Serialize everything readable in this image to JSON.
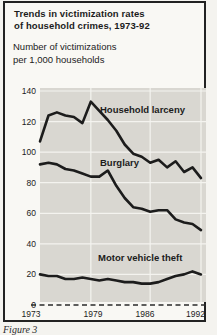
{
  "figure": {
    "title_line1": "Trends in victimization rates",
    "title_line2": "of household crimes, 1973-92",
    "subtitle_line1": "Number of victimizations",
    "subtitle_line2": "per 1,000 households",
    "caption": "Figure 3"
  },
  "colors": {
    "page_bg": "#f4f3ef",
    "figure_bg": "#f9f8f4",
    "border": "#222222",
    "plot_bg": "#d9d7d1",
    "gridline": "#f4f3ef",
    "line": "#1c1c1c",
    "text": "#1c1c1c"
  },
  "chart_data": {
    "type": "line",
    "title": "Trends in victimization rates of household crimes, 1973-92",
    "ylabel": "Number of victimizations per 1,000 households",
    "xlabel": "",
    "x": [
      1973,
      1974,
      1975,
      1976,
      1977,
      1978,
      1979,
      1980,
      1981,
      1982,
      1983,
      1984,
      1985,
      1986,
      1987,
      1988,
      1989,
      1990,
      1991,
      1992
    ],
    "series": [
      {
        "name": "Household larceny",
        "values": [
          107,
          124,
          126,
          124,
          123,
          119,
          133,
          127,
          121,
          114,
          105,
          99,
          97,
          93,
          95,
          90,
          94,
          87,
          90,
          83
        ]
      },
      {
        "name": "Burglary",
        "values": [
          92,
          93,
          92,
          89,
          88,
          86,
          84,
          84,
          88,
          78,
          70,
          64,
          63,
          61,
          62,
          62,
          56,
          54,
          53,
          49
        ]
      },
      {
        "name": "Motor vehicle theft",
        "values": [
          20,
          19,
          19,
          17,
          17,
          18,
          17,
          16,
          17,
          16,
          15,
          15,
          14,
          14,
          15,
          17,
          19,
          20,
          22,
          20
        ]
      }
    ],
    "ylim": [
      0,
      140
    ],
    "yticks": [
      0,
      20,
      40,
      60,
      80,
      100,
      120,
      140
    ],
    "xticks": [
      1973,
      1979,
      1986,
      1992
    ],
    "grid": true,
    "zero_baseline_dashed": true,
    "legend_position": "inline-labels"
  }
}
